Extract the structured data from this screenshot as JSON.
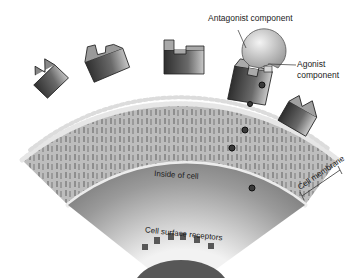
{
  "diagram": {
    "labels": {
      "antagonist": "Antagonist component",
      "agonist_line1": "Agonist",
      "agonist_line2": "component",
      "inside": "Inside of cell",
      "membrane": "Cell membrane",
      "surface_receptors": "Cell surface receptors"
    },
    "colors": {
      "background": "#ffffff",
      "membrane": "#b8b8b8",
      "bead": "#e8e8e8",
      "cytoplasm_dark": "#5a5a5a",
      "cytoplasm_light": "#e0e0e0",
      "receptor_dark": "#3a3a3a",
      "receptor_light": "#c8c8c8",
      "nucleus": "#555555",
      "text": "#222222"
    },
    "receptor_count": 6,
    "signal_particle_count": 5
  }
}
